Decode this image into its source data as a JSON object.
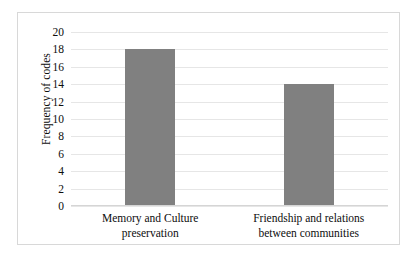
{
  "chart_data": {
    "type": "bar",
    "title": "",
    "xlabel": "",
    "ylabel": "Frequency of codes",
    "categories": [
      "Memory and Culture preservation",
      "Friendship and relations between communities"
    ],
    "category_lines": [
      [
        "Memory and Culture",
        "preservation"
      ],
      [
        "Friendship and relations",
        "between communities"
      ]
    ],
    "values": [
      18,
      14
    ],
    "ylim": [
      0,
      20
    ],
    "ytick_step": 2,
    "ytick_labels": [
      "20",
      "18",
      "16",
      "14",
      "12",
      "10",
      "8",
      "6",
      "4",
      "2",
      "0"
    ],
    "ytick_values": [
      20,
      18,
      16,
      14,
      12,
      10,
      8,
      6,
      4,
      2,
      0
    ],
    "grid": true,
    "legend": false,
    "bar_color": "#808080",
    "gridline_color": "#e6e6e6",
    "border_color": "#d8d8d8",
    "background_color": "#ffffff",
    "text_color": "#0d0d0d"
  }
}
